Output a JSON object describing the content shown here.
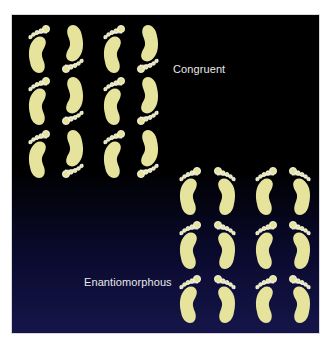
{
  "diagram": {
    "colors": {
      "background_top": "#000000",
      "background_bottom": "#15154a",
      "foot_fill": "#e6e49c",
      "toe_outline": "#ffffff",
      "label_text": "#e8e8e8"
    },
    "labels": {
      "congruent": "Congruent",
      "enantiomorphous": "Enantiomorphous"
    },
    "groups": [
      {
        "name": "congruent",
        "rows": 3,
        "columns": 4,
        "pattern": [
          "left-up",
          "left-down",
          "left-up",
          "left-down"
        ],
        "description": "Same-foot prints alternating orientation (rotations only)"
      },
      {
        "name": "enantiomorphous",
        "rows": 3,
        "columns": 4,
        "pattern": [
          "left-up",
          "right-up",
          "left-up",
          "right-up"
        ],
        "description": "Left and right mirror-image prints"
      }
    ]
  }
}
